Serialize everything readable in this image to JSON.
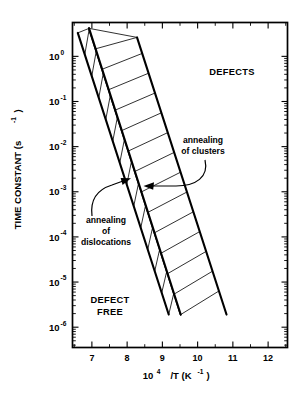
{
  "chart_data": {
    "type": "line",
    "title": "",
    "xlabel": "10^4 /T (K^-1)",
    "xlabel_parts": {
      "base": "10",
      "sup1": "4",
      "mid": "/T (K",
      "sup2": "-1",
      "tail": ")"
    },
    "ylabel": "TIME CONSTANT (s^-1)",
    "ylabel_parts": {
      "base": "TIME CONSTANT  (s",
      "sup": "-1",
      "tail": ")"
    },
    "xlim": [
      6.45,
      12.55
    ],
    "ylim_log": [
      -6.45,
      0.75
    ],
    "grid": false,
    "legend": null,
    "xticks": [
      7,
      8,
      9,
      10,
      11,
      12
    ],
    "xtick_labels": [
      "7",
      "8",
      "9",
      "10",
      "11",
      "12"
    ],
    "yticks_log": [
      0,
      -1,
      -2,
      -3,
      -4,
      -5,
      -6
    ],
    "ytick_labels": [
      {
        "base": "10",
        "exp": "0"
      },
      {
        "base": "10",
        "exp": "-1"
      },
      {
        "base": "10",
        "exp": "-2"
      },
      {
        "base": "10",
        "exp": "-3"
      },
      {
        "base": "10",
        "exp": "-4"
      },
      {
        "base": "10",
        "exp": "-5"
      },
      {
        "base": "10",
        "exp": "-6"
      }
    ],
    "bands": [
      {
        "name": "annealing of dislocations",
        "hatch": "narrow-steep",
        "left_edge": {
          "x1": 6.6,
          "y1_log": 0.52,
          "x2": 9.18,
          "y2_log": -5.72
        },
        "right_edge": {
          "x1": 6.92,
          "y1_log": 0.62,
          "x2": 9.52,
          "y2_log": -5.72
        },
        "hatch_count": 13
      },
      {
        "name": "annealing of clusters",
        "hatch": "wide-shallow",
        "left_edge": {
          "x1": 6.92,
          "y1_log": 0.62,
          "x2": 9.52,
          "y2_log": -5.72
        },
        "right_edge": {
          "x1": 8.28,
          "y1_log": 0.42,
          "x2": 10.82,
          "y2_log": -5.72
        },
        "hatch_count": 14
      }
    ],
    "annotations": [
      {
        "name": "defects-region",
        "text": "DEFECTS",
        "x": 10.55,
        "y_log": -0.28
      },
      {
        "name": "defect-free-region",
        "text_lines": [
          "DEFECT",
          "FREE"
        ],
        "x": 7.55,
        "y_log": -5.05
      },
      {
        "name": "annealing-of-clusters",
        "text_lines": [
          "annealing",
          "of clusters"
        ],
        "x": 9.55,
        "y_log": -1.35,
        "arrow_to": {
          "x": 8.7,
          "y_log": -2.05
        }
      },
      {
        "name": "annealing-of-dislocations",
        "text_lines": [
          "annealing",
          "of",
          "dislocations"
        ],
        "x": 7.62,
        "y_log": -3.35,
        "arrow_to": {
          "x": 8.22,
          "y_log": -2.62
        }
      }
    ]
  },
  "labels": {
    "defects": "DEFECTS",
    "defect_free_line1": "DEFECT",
    "defect_free_line2": "FREE",
    "clusters_line1": "annealing",
    "clusters_line2": "of clusters",
    "dislocations_line1": "annealing",
    "dislocations_line2": "of",
    "dislocations_line3": "dislocations"
  },
  "colors": {
    "ink": "#000000",
    "background": "#ffffff",
    "hatch": "#1a1a1a"
  }
}
